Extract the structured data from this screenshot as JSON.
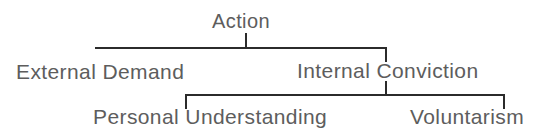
{
  "diagram": {
    "type": "tree",
    "title": "Action",
    "orientation": "top-down",
    "background_color": "#ffffff",
    "text_color": "#5d5d5d",
    "line_color": "#2b2b2b",
    "levels": 3,
    "nodes": {
      "root": "Action",
      "left_branch": "External Demand",
      "right_branch": "Internal Conviction",
      "leaf_left": "Personal Understanding",
      "leaf_right": "Voluntarism"
    },
    "hierarchy": [
      {
        "label": "Action",
        "children": [
          {
            "label": "External Demand",
            "children": []
          },
          {
            "label": "Internal Conviction",
            "children": [
              {
                "label": "Personal Understanding",
                "children": []
              },
              {
                "label": "Voluntarism",
                "children": []
              }
            ]
          }
        ]
      }
    ]
  }
}
